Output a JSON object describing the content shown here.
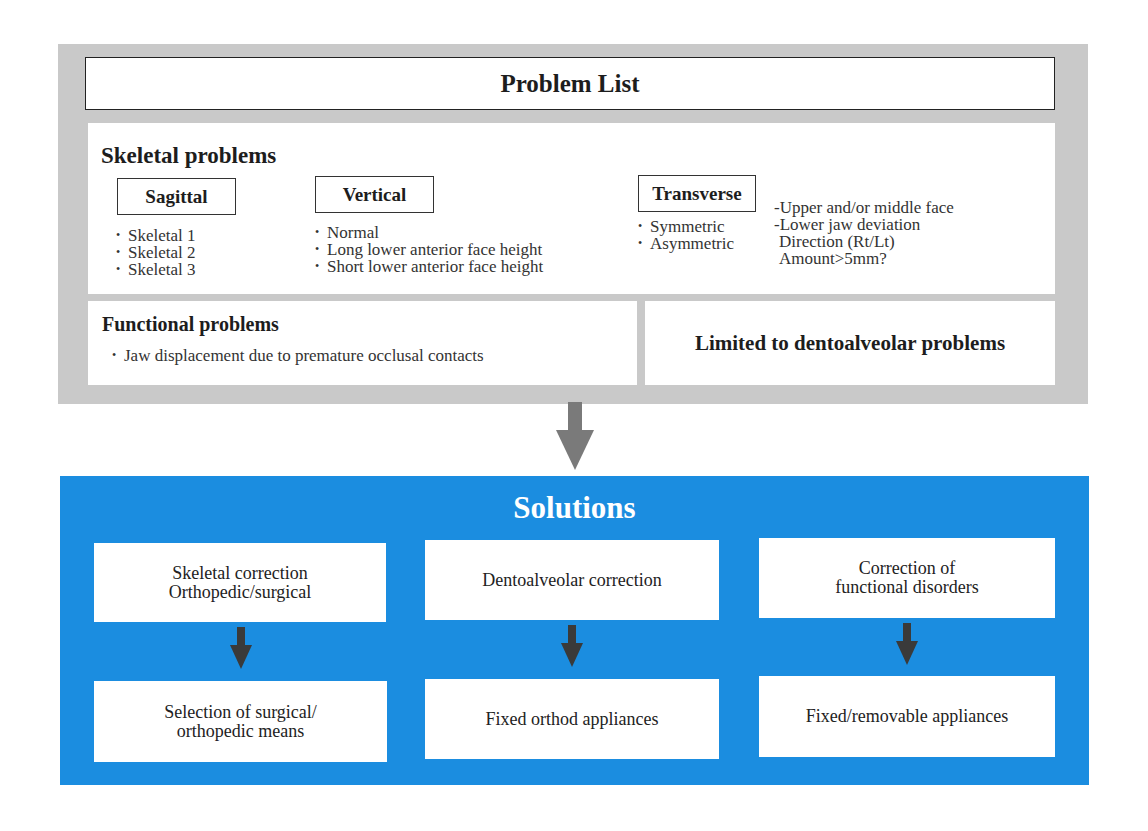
{
  "problem_list": {
    "title": "Problem List",
    "skeletal": {
      "heading": "Skeletal problems",
      "sagittal": {
        "label": "Sagittal",
        "items": [
          "Skeletal 1",
          "Skeletal 2",
          "Skeletal 3"
        ]
      },
      "vertical": {
        "label": "Vertical",
        "items": [
          "Normal",
          "Long lower anterior face height",
          "Short lower anterior face height"
        ]
      },
      "transverse": {
        "label": "Transverse",
        "items": [
          "Symmetric",
          "Asymmetric"
        ],
        "notes": [
          "-Upper and/or middle face",
          "-Lower jaw deviation",
          "Direction (Rt/Lt)",
          "Amount>5mm?"
        ]
      }
    },
    "functional": {
      "heading": "Functional problems",
      "items": [
        "Jaw displacement due to premature occlusal contacts"
      ]
    },
    "limited": {
      "label": "Limited to dentoalveolar problems"
    }
  },
  "solutions": {
    "title": "Solutions",
    "columns": [
      {
        "top": "Skeletal correction\nOrthopedic/surgical",
        "bottom": "Selection of surgical/\northopedic means"
      },
      {
        "top": "Dentoalveolar correction",
        "bottom": "Fixed orthod appliances"
      },
      {
        "top": "Correction of\nfunctional disorders",
        "bottom": "Fixed/removable appliances"
      }
    ]
  },
  "colors": {
    "panel_gray": "#c9c9c9",
    "solutions_blue": "#1b8de0",
    "main_arrow": "#7a7a7a",
    "small_arrow": "#3a3a3a"
  }
}
